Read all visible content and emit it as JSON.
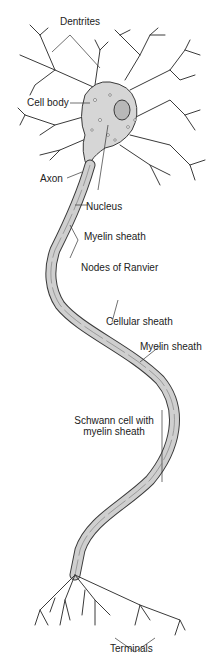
{
  "diagram": {
    "colors": {
      "background": "#ffffff",
      "cell_fill": "#d6d6d6",
      "sheath_fill": "#cfcfcf",
      "outline": "#3a3a3a",
      "label_text": "#222222"
    },
    "labels": {
      "dentrites": "Dentrites",
      "cell_body": "Cell body",
      "axon": "Axon",
      "nucleus": "Nucleus",
      "myelin_sheath_upper": "Myelin sheath",
      "nodes_of_ranvier": "Nodes of Ranvier",
      "cellular_sheath": "Cellular sheath",
      "myelin_sheath_lower": "Myelin sheath",
      "schwann_cell_line1": "Schwann cell with",
      "schwann_cell_line2": "myelin sheath",
      "terminals": "Terminals"
    }
  }
}
